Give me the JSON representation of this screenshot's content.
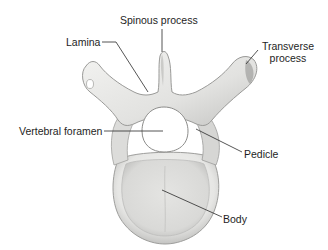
{
  "diagram": {
    "labels": {
      "spinous_process": "Spinous process",
      "lamina": "Lamina",
      "transverse_process_line1": "Transverse",
      "transverse_process_line2": "process",
      "vertebral_foramen": "Vertebral foramen",
      "pedicle": "Pedicle",
      "body": "Body"
    },
    "colors": {
      "background": "#ffffff",
      "bone_light": "#f2f2f0",
      "bone_mid": "#d8d8d6",
      "bone_shadow": "#a9a9a7",
      "leader_line": "#2a2a2a",
      "text": "#1e1e1e"
    }
  }
}
